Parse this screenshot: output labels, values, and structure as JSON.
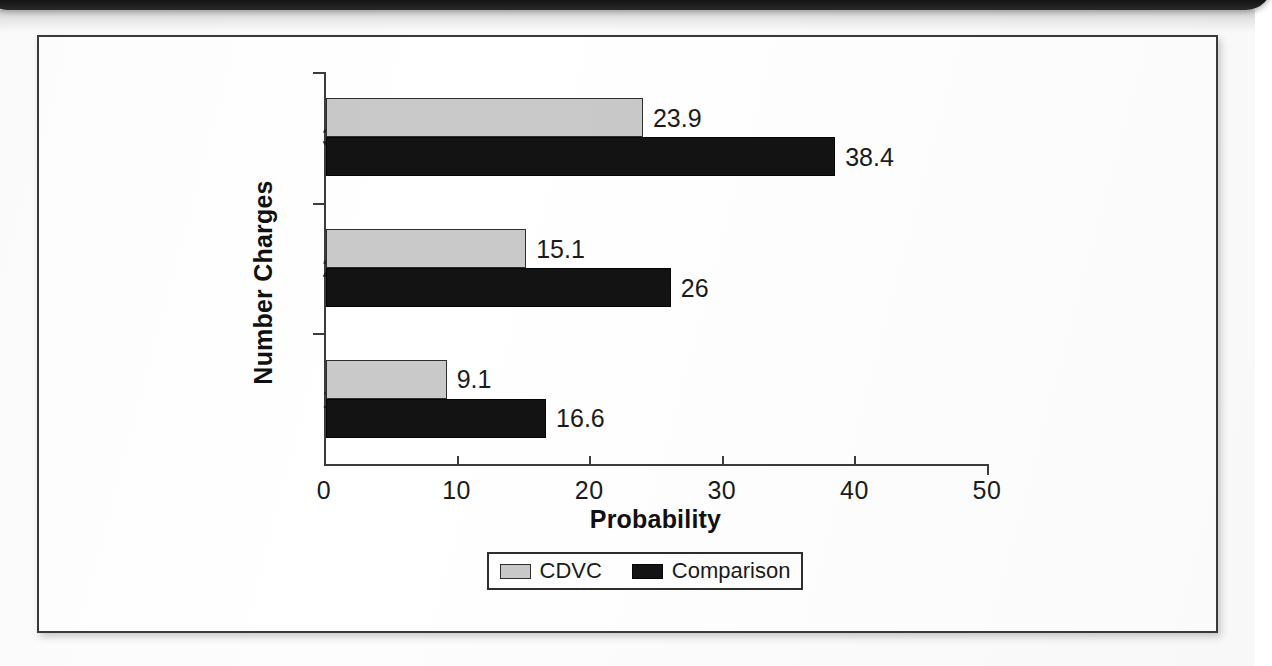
{
  "scan": {
    "top_band_label": "scan-edge-artifact"
  },
  "chart_data": {
    "type": "bar",
    "orientation": "horizontal",
    "title": "",
    "xlabel": "Probability",
    "ylabel": "Number Charges",
    "categories": [
      "1",
      "2",
      "3"
    ],
    "xlim": [
      0,
      50
    ],
    "xticks": [
      "0",
      "10",
      "20",
      "30",
      "40",
      "50"
    ],
    "xtick_values": [
      0,
      10,
      20,
      30,
      40,
      50
    ],
    "grid": false,
    "legend_position": "bottom",
    "series": [
      {
        "name": "CDVC",
        "color": "#c9c9c9",
        "values": [
          9.1,
          15.1,
          23.9
        ],
        "labels": [
          "9.1",
          "15.1",
          "23.9"
        ]
      },
      {
        "name": "Comparison",
        "color": "#131313",
        "values": [
          16.6,
          26,
          38.4
        ],
        "labels": [
          "16.6",
          "26",
          "38.4"
        ]
      }
    ]
  },
  "legend": {
    "entries": [
      {
        "label": "CDVC",
        "swatch": "cdvc"
      },
      {
        "label": "Comparison",
        "swatch": "comparison"
      }
    ]
  },
  "colors": {
    "series_cdvc": "#c9c9c9",
    "series_comparison": "#131313",
    "axis": "#3c3c3c",
    "frame": "#3a3a3a",
    "text": "#1b1b1b"
  }
}
